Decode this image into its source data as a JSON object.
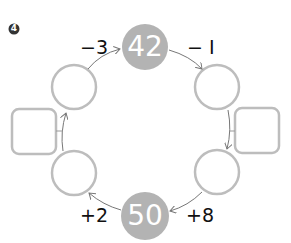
{
  "problem": {
    "number": "4",
    "start_value": "42",
    "end_value": "50",
    "operations": {
      "top_left": "−3",
      "top_right": "− I",
      "bottom_left": "+2",
      "bottom_right": "+8"
    },
    "blank_circles": 4,
    "blank_squares": 2
  },
  "colors": {
    "filled_circle": "#b3b3b3",
    "outline": "#bdbdbd",
    "arrow": "#777777",
    "badge": "#333333"
  }
}
